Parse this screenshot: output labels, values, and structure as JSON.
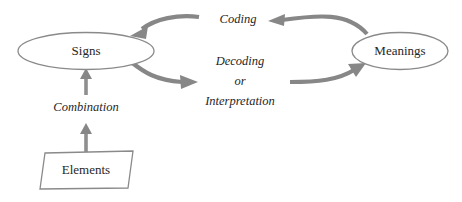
{
  "diagram": {
    "colors": {
      "shape_stroke": "#8a8a8a",
      "arrow": "#878787",
      "text": "#262626",
      "background": "#ffffff"
    },
    "nodes": [
      {
        "id": "signs",
        "label": "Signs",
        "shape": "ellipse",
        "cx": 86,
        "cy": 51,
        "rx": 68,
        "ry": 18.5
      },
      {
        "id": "meanings",
        "label": "Meanings",
        "shape": "ellipse",
        "cx": 400,
        "cy": 51,
        "rx": 48,
        "ry": 18.5
      },
      {
        "id": "elements",
        "label": "Elements",
        "shape": "parallelogram",
        "cx": 86,
        "cy": 170
      }
    ],
    "edges": [
      {
        "id": "coding",
        "label": "Coding",
        "from": "meanings",
        "to": "signs",
        "label_x": 238,
        "label_y": 20
      },
      {
        "id": "decoding",
        "label_lines": [
          "Decoding",
          "or",
          "Interpretation"
        ],
        "from": "signs",
        "to": "meanings",
        "label_x": 240,
        "label_y": 80
      },
      {
        "id": "combination",
        "label": "Combination",
        "from": "elements",
        "to": "signs",
        "label_x": 86,
        "label_y": 108
      }
    ]
  }
}
